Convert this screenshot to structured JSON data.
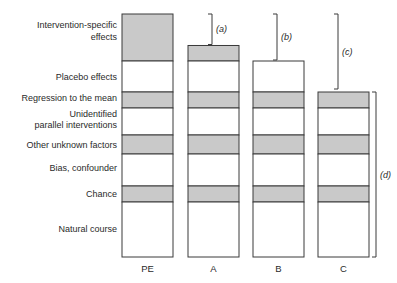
{
  "diagram": {
    "components": [
      {
        "key": "intervention",
        "label_lines": [
          "Intervention-specific",
          "effects"
        ],
        "shaded": true
      },
      {
        "key": "placebo",
        "label_lines": [
          "Placebo effects"
        ],
        "shaded": false
      },
      {
        "key": "regression",
        "label_lines": [
          "Regression to the mean"
        ],
        "shaded": true
      },
      {
        "key": "parallel",
        "label_lines": [
          "Unidentified",
          "parallel interventions"
        ],
        "shaded": false
      },
      {
        "key": "unknown",
        "label_lines": [
          "Other unknown factors"
        ],
        "shaded": true
      },
      {
        "key": "bias",
        "label_lines": [
          "Bias, confounder"
        ],
        "shaded": false
      },
      {
        "key": "chance",
        "label_lines": [
          "Chance"
        ],
        "shaded": true
      },
      {
        "key": "natural",
        "label_lines": [
          "Natural course"
        ],
        "shaded": false
      }
    ],
    "columns": [
      {
        "label": "PE",
        "top_component": "intervention",
        "intervention_fraction": 1.0
      },
      {
        "label": "A",
        "top_component": "intervention",
        "intervention_fraction": 0.33
      },
      {
        "label": "B",
        "top_component": "placebo",
        "intervention_fraction": 0
      },
      {
        "label": "C",
        "top_component": "regression",
        "intervention_fraction": 0
      }
    ],
    "brackets": [
      {
        "label": "(a)",
        "from": "PE-top",
        "to": "A-top"
      },
      {
        "label": "(b)",
        "from": "PE-top",
        "to": "B-top"
      },
      {
        "label": "(c)",
        "from": "PE-top",
        "to": "C-top"
      },
      {
        "label": "(d)",
        "from": "C-top",
        "to": "bottom"
      }
    ],
    "colors": {
      "shade": "#c9c9c9",
      "stroke": "#3a3a3a",
      "text": "#2a2a2a"
    }
  }
}
